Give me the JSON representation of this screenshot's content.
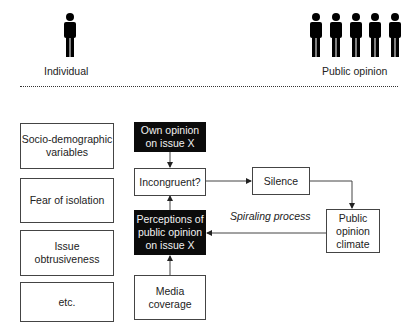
{
  "header": {
    "individual_label": "Individual",
    "public_opinion_label": "Public opinion",
    "individual_icon": "person-icon",
    "crowd_icon": "group-of-people-icon",
    "crowd_count_visible": 5
  },
  "factors": [
    {
      "label": "Socio-demographic\nvariables"
    },
    {
      "label": "Fear of isolation"
    },
    {
      "label": "Issue\nobtrusiveness"
    },
    {
      "label": "etc."
    }
  ],
  "nodes": {
    "own_opinion": "Own opinion\non issue X",
    "incongruent": "Incongruent?",
    "perceptions": "Perceptions of\npublic opinion\non issue X",
    "media": "Media\ncoverage",
    "silence": "Silence",
    "climate": "Public\nopinion\nclimate"
  },
  "annotations": {
    "spiral": "Spiraling process"
  },
  "colors": {
    "dark_box": "#0b0b0b",
    "line": "#444444"
  }
}
